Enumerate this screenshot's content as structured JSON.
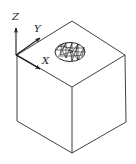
{
  "diagram": {
    "type": "isometric-cube-with-coordinate-frame",
    "axes": {
      "z_label": "Z",
      "y_label": "Y",
      "x_label": "X"
    },
    "cube": {
      "top_face": "top",
      "feature": "meshed elliptical region on top face"
    },
    "colors": {
      "line": "#2a2a2a",
      "background": "#ffffff"
    }
  }
}
